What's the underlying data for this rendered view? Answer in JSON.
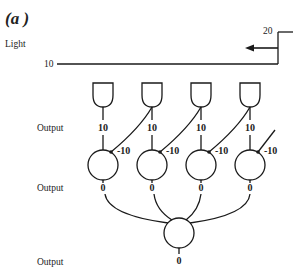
{
  "figure": {
    "panel_label": "(a )",
    "light_label": "Light",
    "light_level_left": "10",
    "light_level_right": "20",
    "row_labels": {
      "receptor_output": "Output",
      "layer1_output": "Output",
      "final_output": "Output"
    },
    "receptors": [
      {
        "output": "10"
      },
      {
        "output": "10"
      },
      {
        "output": "10"
      },
      {
        "output": "10"
      }
    ],
    "neurons": [
      {
        "inhibition": "-10",
        "output": "0"
      },
      {
        "inhibition": "-10",
        "output": "0"
      },
      {
        "inhibition": "-10",
        "output": "0"
      },
      {
        "inhibition": "-10",
        "output": "0"
      }
    ],
    "final_neuron": {
      "output": "0"
    },
    "colors": {
      "ink": "#1a1a1a",
      "background": "#ffffff"
    }
  }
}
